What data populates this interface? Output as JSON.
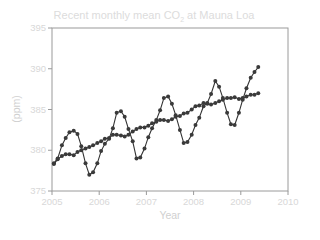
{
  "chart_data": {
    "type": "line",
    "title": "Recent monthly mean CO2 at Mauna Loa",
    "title_parts": {
      "pre": "Recent monthly mean CO",
      "sub": "2",
      "post": " at Mauna Loa"
    },
    "xlabel": "Year",
    "ylabel": "(ppm)",
    "xlim": [
      2005,
      2010
    ],
    "ylim": [
      375,
      395
    ],
    "xticks": [
      "2005",
      "2006",
      "2007",
      "2008",
      "2009",
      "2010"
    ],
    "yticks": [
      "375",
      "380",
      "385",
      "390",
      "395"
    ],
    "grid": false,
    "legend": null,
    "colors": {
      "line": "#333333",
      "marker": "#3a3a3a",
      "axis": "#999999",
      "text": "#d8d8d8"
    },
    "series": [
      {
        "name": "Monthly mean",
        "x": [
          2005.04,
          2005.12,
          2005.21,
          2005.29,
          2005.37,
          2005.46,
          2005.54,
          2005.62,
          2005.71,
          2005.79,
          2005.87,
          2005.96,
          2006.04,
          2006.12,
          2006.21,
          2006.29,
          2006.37,
          2006.46,
          2006.54,
          2006.62,
          2006.71,
          2006.79,
          2006.87,
          2006.96,
          2007.04,
          2007.12,
          2007.21,
          2007.29,
          2007.37,
          2007.46,
          2007.54,
          2007.62,
          2007.71,
          2007.79,
          2007.87,
          2007.96,
          2008.04,
          2008.12,
          2008.21,
          2008.29,
          2008.37,
          2008.46,
          2008.54,
          2008.62,
          2008.71,
          2008.79,
          2008.87,
          2008.96,
          2009.04,
          2009.12,
          2009.21,
          2009.29,
          2009.37
        ],
        "values": [
          378.4,
          379.0,
          380.6,
          381.5,
          382.2,
          382.4,
          382.0,
          380.5,
          378.4,
          377.0,
          377.3,
          378.4,
          379.9,
          380.8,
          381.4,
          382.7,
          384.6,
          384.8,
          384.1,
          382.6,
          381.1,
          379.0,
          379.1,
          380.2,
          381.6,
          382.7,
          383.7,
          384.9,
          386.4,
          386.6,
          385.7,
          384.3,
          382.5,
          380.9,
          381.0,
          381.9,
          383.1,
          384.0,
          385.4,
          385.8,
          386.9,
          388.5,
          387.8,
          386.4,
          384.6,
          383.2,
          383.1,
          384.6,
          386.2,
          387.6,
          388.9,
          389.6,
          390.2
        ]
      },
      {
        "name": "Seasonally adjusted trend",
        "x": [
          2005.04,
          2005.12,
          2005.21,
          2005.29,
          2005.37,
          2005.46,
          2005.54,
          2005.62,
          2005.71,
          2005.79,
          2005.87,
          2005.96,
          2006.04,
          2006.12,
          2006.21,
          2006.29,
          2006.37,
          2006.46,
          2006.54,
          2006.62,
          2006.71,
          2006.79,
          2006.87,
          2006.96,
          2007.04,
          2007.12,
          2007.21,
          2007.29,
          2007.37,
          2007.46,
          2007.54,
          2007.62,
          2007.71,
          2007.79,
          2007.87,
          2007.96,
          2008.04,
          2008.12,
          2008.21,
          2008.29,
          2008.37,
          2008.46,
          2008.54,
          2008.62,
          2008.71,
          2008.79,
          2008.87,
          2008.96,
          2009.04,
          2009.12,
          2009.21,
          2009.29,
          2009.37
        ],
        "values": [
          378.3,
          378.9,
          379.3,
          379.5,
          379.5,
          379.4,
          379.8,
          380.0,
          380.2,
          380.4,
          380.6,
          380.9,
          381.1,
          381.4,
          381.5,
          381.9,
          381.9,
          381.8,
          381.7,
          381.9,
          382.3,
          382.6,
          382.8,
          382.8,
          383.0,
          383.3,
          383.5,
          383.7,
          383.7,
          383.6,
          383.8,
          384.1,
          384.2,
          384.5,
          384.6,
          385.0,
          385.4,
          385.5,
          385.8,
          385.7,
          385.6,
          385.8,
          386.0,
          386.2,
          386.4,
          386.4,
          386.5,
          386.3,
          386.4,
          386.6,
          386.8,
          386.8,
          387.0
        ]
      }
    ]
  }
}
